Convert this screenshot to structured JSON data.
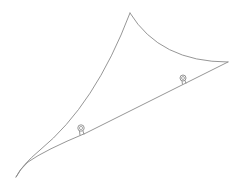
{
  "figure": {
    "stroke_color": "#8a8a8a",
    "background": "#ffffff",
    "shape": {
      "apex_top": [
        130,
        13
      ],
      "apex_right": [
        228,
        62
      ],
      "apex_bottom_left": [
        16,
        177
      ]
    },
    "rings": [
      {
        "label": "ring-left",
        "cx": 81,
        "cy": 128
      },
      {
        "label": "ring-right",
        "cx": 183,
        "cy": 78
      }
    ]
  }
}
